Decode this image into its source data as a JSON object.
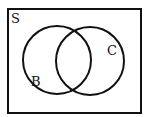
{
  "diagram": {
    "type": "venn",
    "universe": {
      "label": "S",
      "x": 8,
      "y": 9,
      "width": 133,
      "height": 104
    },
    "sets": [
      {
        "label": "B",
        "cx": 57,
        "cy": 60,
        "r": 34,
        "label_x": 32,
        "label_y": 85
      },
      {
        "label": "C",
        "cx": 90,
        "cy": 61,
        "r": 34,
        "label_x": 108,
        "label_y": 54
      }
    ],
    "stroke_color": "#111111",
    "background_color": "#ffffff"
  }
}
